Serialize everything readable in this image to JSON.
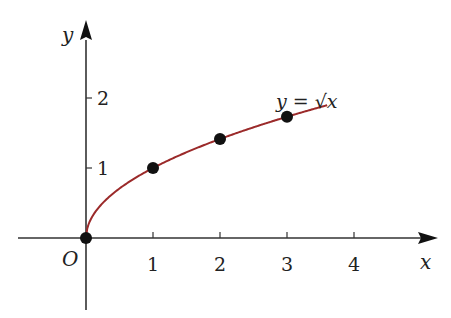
{
  "chart_data": {
    "type": "line",
    "title": "",
    "function_label": "y = √x",
    "xlabel": "x",
    "ylabel": "y",
    "origin_label": "O",
    "xlim": [
      -1.2,
      5.2
    ],
    "ylim": [
      -1.0,
      2.8
    ],
    "x_ticks": [
      1,
      2,
      3,
      4
    ],
    "x_tick_labels": [
      "1",
      "2",
      "3",
      "4"
    ],
    "y_ticks": [
      1,
      2
    ],
    "y_tick_labels": [
      "1",
      "2"
    ],
    "grid": false,
    "series": [
      {
        "name": "y = √x",
        "color": "#9b2a2a",
        "x_range": [
          0,
          3.6
        ],
        "highlighted_points": [
          {
            "x": 0,
            "y": 0
          },
          {
            "x": 1,
            "y": 1
          },
          {
            "x": 2,
            "y": 1.414
          },
          {
            "x": 3,
            "y": 1.732
          }
        ]
      }
    ]
  },
  "colors": {
    "axis": "#333333",
    "curve": "#9b2a2a",
    "points": "#111111"
  }
}
